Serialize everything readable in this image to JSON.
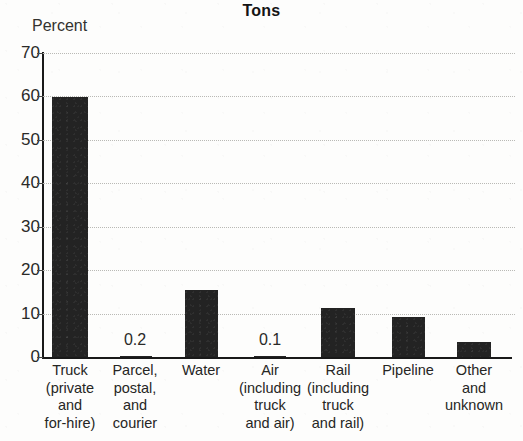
{
  "chart_data": {
    "type": "bar",
    "title": "Tons",
    "xlabel": "",
    "ylabel": "Percent",
    "ylim": [
      0,
      70
    ],
    "ytick_labels": [
      "70",
      "60",
      "50",
      "40",
      "30",
      "20",
      "10",
      "0"
    ],
    "ytick_values": [
      70,
      60,
      50,
      40,
      30,
      20,
      10,
      0
    ],
    "grid": "horizontal-dotted",
    "legend": "none",
    "categories": [
      "Truck\n(private\nand\nfor-hire)",
      "Parcel,\npostal,\nand\ncourier",
      "Water",
      "Air\n(including\ntruck\nand air)",
      "Rail\n(including\ntruck\nand rail)",
      "Pipeline",
      "Other\nand\nunknown"
    ],
    "values": [
      59.8,
      0.2,
      15.5,
      0.1,
      11.2,
      9.2,
      3.5
    ],
    "value_annotations": [
      {
        "category_index": 1,
        "text": "0.2"
      },
      {
        "category_index": 3,
        "text": "0.1"
      }
    ],
    "bar_color": "#232323",
    "axis_color": "#191919",
    "grid_color": "#b9b9b5"
  }
}
